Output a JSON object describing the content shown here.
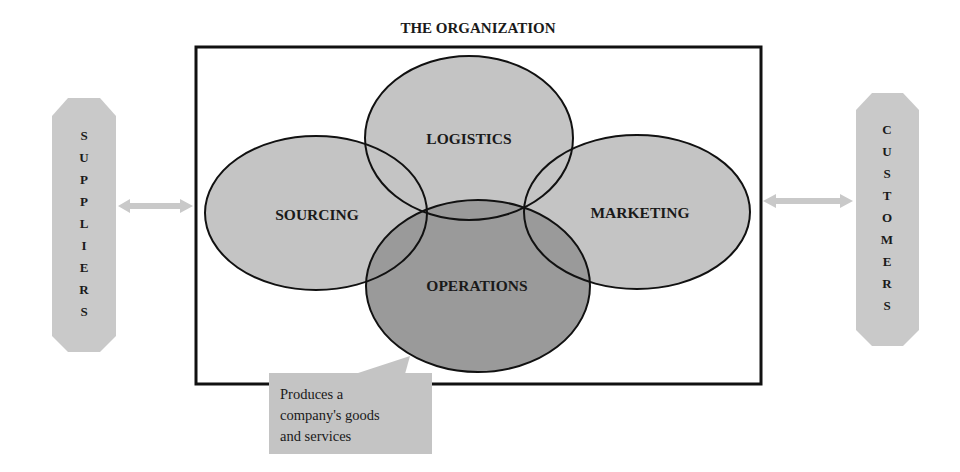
{
  "title": "THE ORGANIZATION",
  "functions": [
    {
      "id": "logistics",
      "label": "LOGISTICS"
    },
    {
      "id": "sourcing",
      "label": "SOURCING"
    },
    {
      "id": "marketing",
      "label": "MARKETING"
    },
    {
      "id": "operations",
      "label": "OPERATIONS"
    }
  ],
  "suppliers": {
    "label": "SUPPLIERS",
    "letters": [
      "S",
      "U",
      "P",
      "P",
      "L",
      "I",
      "E",
      "R",
      "S"
    ]
  },
  "customers": {
    "label": "CUSTOMERS",
    "letters": [
      "C",
      "U",
      "S",
      "T",
      "O",
      "M",
      "E",
      "R",
      "S"
    ]
  },
  "callout": {
    "lines": [
      "Produces a",
      "company's goods",
      "and services"
    ]
  },
  "colors": {
    "ellipse_fill": "#c4c4c4",
    "operations_fill": "#9a9a9a",
    "banner_fill": "#c9c9c9",
    "arrow_fill": "#c9c9c9",
    "callout_fill": "#c4c4c4",
    "frame_stroke": "#111111"
  }
}
